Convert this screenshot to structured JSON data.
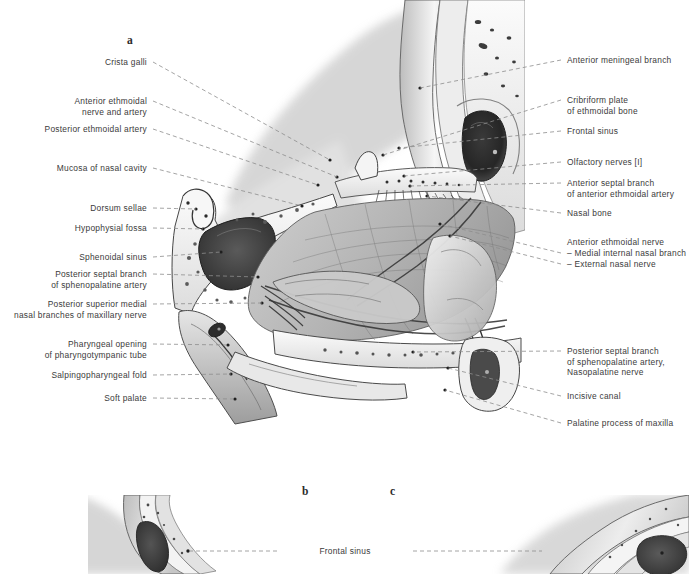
{
  "plate": {
    "figure_letters": [
      {
        "text": "a",
        "x": 127,
        "y": 34
      },
      {
        "text": "b",
        "x": 302,
        "y": 485
      },
      {
        "text": "c",
        "x": 390,
        "y": 485
      }
    ]
  },
  "labels_left": [
    {
      "id": "crista-galli",
      "lines": [
        "Crista galli"
      ],
      "x_right": 147,
      "y": 57,
      "tip_x": 330,
      "tip_y": 160
    },
    {
      "id": "anterior-ethmoidal-nerve",
      "lines": [
        "Anterior ethmoidal",
        "nerve and artery"
      ],
      "x_right": 147,
      "y": 96,
      "tip_x": 337,
      "tip_y": 177
    },
    {
      "id": "posterior-ethmoidal-artery",
      "lines": [
        "Posterior ethmoidal artery"
      ],
      "x_right": 147,
      "y": 124,
      "tip_x": 318,
      "tip_y": 185
    },
    {
      "id": "mucosa-of-nasal-cavity",
      "lines": [
        "Mucosa of nasal cavity"
      ],
      "x_right": 147,
      "y": 163,
      "tip_x": 302,
      "tip_y": 206
    },
    {
      "id": "dorsum-sellae",
      "lines": [
        "Dorsum sellae"
      ],
      "x_right": 147,
      "y": 203,
      "tip_x": 196,
      "tip_y": 209
    },
    {
      "id": "hypophysial-fossa",
      "lines": [
        "Hypophysial fossa"
      ],
      "x_right": 147,
      "y": 223,
      "tip_x": 203,
      "tip_y": 229
    },
    {
      "id": "sphenoidal-sinus",
      "lines": [
        "Sphenoidal sinus"
      ],
      "x_right": 147,
      "y": 252,
      "tip_x": 221,
      "tip_y": 252
    },
    {
      "id": "posterior-septal-branch-sp",
      "lines": [
        "Posterior septal branch",
        "of sphenopalatine artery"
      ],
      "x_right": 147,
      "y": 269,
      "tip_x": 258,
      "tip_y": 277
    },
    {
      "id": "post-sup-medial-nasal",
      "lines": [
        "Posterior superior medial",
        "nasal branches of maxillary nerve"
      ],
      "x_right": 147,
      "y": 299,
      "tip_x": 262,
      "tip_y": 303
    },
    {
      "id": "pharyngeal-opening",
      "lines": [
        "Pharyngeal opening",
        "of pharyngotympanic tube"
      ],
      "x_right": 147,
      "y": 339,
      "tip_x": 228,
      "tip_y": 345
    },
    {
      "id": "salpingopharyngeal-fold",
      "lines": [
        "Salpingopharyngeal fold"
      ],
      "x_right": 147,
      "y": 370,
      "tip_x": 231,
      "tip_y": 374
    },
    {
      "id": "soft-palate",
      "lines": [
        "Soft palate"
      ],
      "x_right": 147,
      "y": 393,
      "tip_x": 235,
      "tip_y": 399
    }
  ],
  "labels_right": [
    {
      "id": "anterior-meningeal-branch",
      "lines": [
        "Anterior meningeal branch"
      ],
      "x_left": 567,
      "y": 55,
      "tip_x": 420,
      "tip_y": 88
    },
    {
      "id": "cribriform-plate",
      "lines": [
        "Cribriform plate",
        "of ethmoidal bone"
      ],
      "x_left": 567,
      "y": 95,
      "tip_x": 383,
      "tip_y": 155
    },
    {
      "id": "frontal-sinus",
      "lines": [
        "Frontal sinus"
      ],
      "x_left": 567,
      "y": 126,
      "tip_x": 399,
      "tip_y": 148
    },
    {
      "id": "olfactory-nerves",
      "lines": [
        "Olfactory nerves [I]"
      ],
      "x_left": 567,
      "y": 157,
      "tip_x": 404,
      "tip_y": 176
    },
    {
      "id": "anterior-septal-branch",
      "lines": [
        "Anterior septal branch",
        "of anterior ethmoidal artery"
      ],
      "x_left": 567,
      "y": 178,
      "tip_x": 410,
      "tip_y": 186
    },
    {
      "id": "nasal-bone",
      "lines": [
        "Nasal bone"
      ],
      "x_left": 567,
      "y": 208,
      "tip_x": 427,
      "tip_y": 196
    },
    {
      "id": "anterior-ethmoidal-nerve-r",
      "lines": [
        "Anterior ethmoidal nerve"
      ],
      "x_left": 567,
      "y": 237,
      "tip_x": 567,
      "tip_y": 237,
      "no_leader": true
    },
    {
      "id": "medial-internal-nasal-branch",
      "lines": [
        "– Medial internal nasal branch"
      ],
      "x_left": 567,
      "y": 248,
      "tip_x": 440,
      "tip_y": 224
    },
    {
      "id": "external-nasal-nerve",
      "lines": [
        "– External nasal nerve"
      ],
      "x_left": 567,
      "y": 259,
      "tip_x": 450,
      "tip_y": 236
    },
    {
      "id": "posterior-septal-branch-nas",
      "lines": [
        "Posterior septal branch",
        "of sphenopalatine artery,",
        "Nasopalatine nerve"
      ],
      "x_left": 567,
      "y": 346,
      "tip_x": 413,
      "tip_y": 352
    },
    {
      "id": "incisive-canal",
      "lines": [
        "Incisive canal"
      ],
      "x_left": 567,
      "y": 391,
      "tip_x": 448,
      "tip_y": 368
    },
    {
      "id": "palatine-process-of-maxilla",
      "lines": [
        "Palatine process of maxilla"
      ],
      "x_left": 567,
      "y": 418,
      "tip_x": 445,
      "tip_y": 390
    }
  ],
  "labels_bottom": [
    {
      "id": "frontal-sinus-bc",
      "lines": [
        "Frontal sinus"
      ],
      "x_center": 345,
      "y": 546,
      "left_tip_x": 188,
      "left_tip_y": 551,
      "right_tip_x": 542,
      "right_tip_y": 551
    }
  ],
  "colors": {
    "page_background": "#ffffff",
    "label_text": "#3b3b3b",
    "leader_line": "#8a8a8a",
    "figure_letter": "#2b2b2b",
    "artwork_ink_dark": "#2e2e2e",
    "artwork_mid_gray": "#8e8e8e",
    "artwork_light_gray": "#cfcfcf"
  },
  "artwork": {
    "figure_a": {
      "name": "sagittal-section-nasal-septum",
      "x": 165,
      "y": 0,
      "width": 360,
      "height": 432
    },
    "figure_b": {
      "name": "frontal-sinus-variant-b",
      "x": 88,
      "y": 495,
      "width": 175,
      "height": 79
    },
    "figure_c": {
      "name": "frontal-sinus-variant-c",
      "x": 460,
      "y": 495,
      "width": 229,
      "height": 79
    }
  }
}
